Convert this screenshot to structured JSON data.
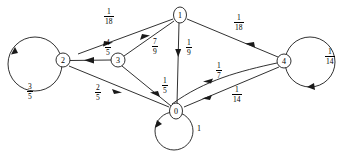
{
  "figure": {
    "type": "directed-graph"
  },
  "nodes": [
    {
      "id": "0",
      "label": "0",
      "cx": 176,
      "cy": 111,
      "r": 7.5
    },
    {
      "id": "1",
      "label": "1",
      "cx": 180,
      "cy": 15,
      "r": 7.5
    },
    {
      "id": "2",
      "label": "2",
      "cx": 63,
      "cy": 60,
      "r": 7.0
    },
    {
      "id": "3",
      "label": "3",
      "cx": 118,
      "cy": 60,
      "r": 7.0
    },
    {
      "id": "4",
      "label": "4",
      "cx": 284,
      "cy": 61,
      "r": 7.0
    }
  ],
  "edges": [
    {
      "from": "1",
      "to": "2",
      "weight_num": "1",
      "weight_den": "18",
      "label": "1/18"
    },
    {
      "from": "1",
      "to": "3",
      "weight_num": "7",
      "weight_den": "9",
      "label": "7/9"
    },
    {
      "from": "1",
      "to": "0",
      "weight_num": "1",
      "weight_den": "9",
      "label": "1/9"
    },
    {
      "from": "1",
      "to": "4",
      "weight_num": "1",
      "weight_den": "18",
      "label": "1/18"
    },
    {
      "from": "3",
      "to": "2",
      "weight_num": "4",
      "weight_den": "5",
      "label": "4/5"
    },
    {
      "from": "3",
      "to": "0",
      "weight_num": "1",
      "weight_den": "5",
      "label": "1/5"
    },
    {
      "from": "0",
      "to": "2",
      "weight_num": "2",
      "weight_den": "5",
      "label": "2/5"
    },
    {
      "from": "0",
      "to": "4",
      "weight_num": "1",
      "weight_den": "14",
      "label": "1/14"
    },
    {
      "from": "4",
      "to": "0",
      "weight_num": "1",
      "weight_den": "7",
      "label": "1/7"
    }
  ],
  "self_loops": [
    {
      "node": "2",
      "weight_num": "3",
      "weight_den": "5",
      "label": "3/5"
    },
    {
      "node": "4",
      "weight_num": "1",
      "weight_den": "14",
      "label": "1/14"
    },
    {
      "node": "0",
      "weight_whole": "1",
      "label": "1"
    }
  ],
  "labels": {
    "one_eighteenth_left": {
      "num": "1",
      "den": "18"
    },
    "one_eighteenth_right": {
      "num": "1",
      "den": "18"
    },
    "seven_ninths": {
      "num": "7",
      "den": "9"
    },
    "one_ninth": {
      "num": "1",
      "den": "9"
    },
    "four_fifths": {
      "num": "4",
      "den": "5"
    },
    "one_fifth": {
      "num": "1",
      "den": "5"
    },
    "two_fifths": {
      "num": "2",
      "den": "5"
    },
    "three_fifths": {
      "num": "3",
      "den": "5"
    },
    "one_seventh": {
      "num": "1",
      "den": "7"
    },
    "one_fourteenth_mid": {
      "num": "1",
      "den": "14"
    },
    "one_fourteenth_right": {
      "num": "1",
      "den": "14"
    },
    "one_whole": {
      "whole": "1"
    }
  },
  "colors": {
    "stroke": "#1a1a1a",
    "background": "#ffffff",
    "text": "#000000"
  }
}
